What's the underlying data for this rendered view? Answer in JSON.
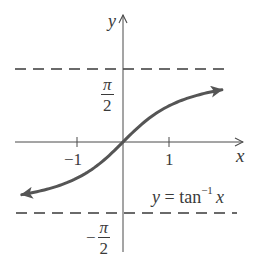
{
  "chart_data": {
    "type": "line",
    "title": "",
    "function_label": "y = tan^-1 x",
    "function": "arctan",
    "xlabel": "x",
    "ylabel": "y",
    "x_ticks": [
      -1,
      1
    ],
    "x_tick_labels": [
      "−1",
      "1"
    ],
    "y_tick_labels": [
      "π/2",
      "−π/2"
    ],
    "asymptotes": [
      {
        "y": 1.5708,
        "label": "π/2",
        "style": "dashed"
      },
      {
        "y": -1.5708,
        "label": "−π/2",
        "style": "dashed"
      }
    ],
    "xlim": [
      -2.35,
      2.6
    ],
    "ylim": [
      -2.4,
      2.8
    ],
    "series": [
      {
        "name": "y = tan^-1 x",
        "x": [
          -2.2,
          -2.0,
          -1.5,
          -1.0,
          -0.5,
          0,
          0.5,
          1.0,
          1.5,
          2.0,
          2.15
        ],
        "values": [
          -1.144,
          -1.107,
          -0.983,
          -0.785,
          -0.464,
          0,
          0.464,
          0.785,
          0.983,
          1.107,
          1.135
        ],
        "color": "#555555",
        "arrows": "both"
      }
    ],
    "grid": false,
    "legend": null
  },
  "labels": {
    "y_axis": "y",
    "x_axis": "x",
    "tick_neg1": "−1",
    "tick_pos1": "1",
    "pi_num": "π",
    "pi_den": "2",
    "minus": "−",
    "func_prefix": "y = tan",
    "func_sup": "−1",
    "func_var": "x"
  },
  "colors": {
    "axis": "#4a4a4a",
    "curve": "#555555",
    "dash": "#3a3a3a",
    "text": "#3a3a3a"
  }
}
